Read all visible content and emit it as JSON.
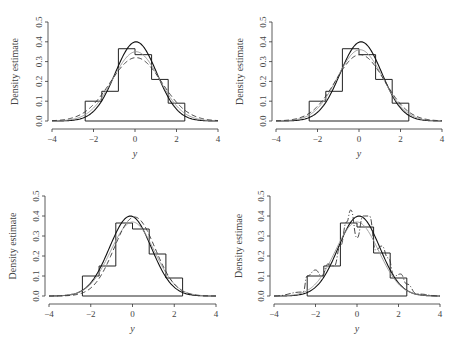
{
  "chart_data": [
    {
      "type": "line",
      "panel": "top-left",
      "xlabel": "y",
      "ylabel": "Density estimate",
      "xlim": [
        -4,
        4
      ],
      "ylim": [
        0,
        0.5
      ],
      "xticks": [
        "-4",
        "-2",
        "0",
        "2",
        "4"
      ],
      "yticks": [
        "0.0",
        "0.1",
        "0.2",
        "0.3",
        "0.4",
        "0.5"
      ],
      "histogram": {
        "bin_edges": [
          -2.4,
          -1.6,
          -0.8,
          0.0,
          0.8,
          1.6,
          2.4
        ],
        "heights": [
          0.1,
          0.15,
          0.365,
          0.335,
          0.21,
          0.09
        ]
      },
      "series": [
        {
          "name": "true density (solid)",
          "style": "solid",
          "peak": 0.4,
          "sd": 1.0,
          "mean": 0.05
        },
        {
          "name": "estimate (gray)",
          "style": "gray",
          "peak": 0.35,
          "sd": 1.12,
          "mean": 0.05
        },
        {
          "name": "estimate (dashed)",
          "style": "dashed",
          "peak": 0.32,
          "sd": 1.25,
          "mean": 0.05
        }
      ],
      "grid": false
    },
    {
      "type": "line",
      "panel": "top-right",
      "xlabel": "y",
      "ylabel": "Density estimate",
      "xlim": [
        -4,
        4
      ],
      "ylim": [
        0,
        0.5
      ],
      "xticks": [
        "-4",
        "-2",
        "0",
        "2",
        "4"
      ],
      "yticks": [
        "0.0",
        "0.1",
        "0.2",
        "0.3",
        "0.4",
        "0.5"
      ],
      "histogram": {
        "bin_edges": [
          -2.4,
          -1.6,
          -0.8,
          0.0,
          0.8,
          1.6,
          2.4
        ],
        "heights": [
          0.1,
          0.15,
          0.365,
          0.335,
          0.21,
          0.09
        ]
      },
      "series": [
        {
          "name": "true density (solid)",
          "style": "solid",
          "peak": 0.4,
          "sd": 1.0,
          "mean": 0.1
        },
        {
          "name": "estimate (gray)",
          "style": "gray",
          "peak": 0.36,
          "sd": 1.1,
          "mean": 0.05
        },
        {
          "name": "estimate (dashed)",
          "style": "dashed",
          "peak": 0.335,
          "sd": 1.18,
          "mean": 0.05
        }
      ],
      "grid": false
    },
    {
      "type": "line",
      "panel": "bottom-left",
      "xlabel": "y",
      "ylabel": "Density estimate",
      "xlim": [
        -4,
        4
      ],
      "ylim": [
        0,
        0.5
      ],
      "xticks": [
        "-4",
        "-2",
        "0",
        "2",
        "4"
      ],
      "yticks": [
        "0.0",
        "0.1",
        "0.2",
        "0.3",
        "0.4",
        "0.5"
      ],
      "histogram": {
        "bin_edges": [
          -2.4,
          -1.6,
          -0.8,
          0.0,
          0.8,
          1.6,
          2.4
        ],
        "heights": [
          0.1,
          0.15,
          0.365,
          0.335,
          0.21,
          0.09
        ]
      },
      "series": [
        {
          "name": "true density (solid)",
          "style": "solid",
          "peak": 0.4,
          "sd": 1.0,
          "mean": -0.1
        },
        {
          "name": "estimate (gray)",
          "style": "gray",
          "peak": 0.37,
          "sd": 1.05,
          "mean": 0.0
        },
        {
          "name": "estimate (dashed)",
          "style": "dashed",
          "peak": 0.395,
          "sd": 0.98,
          "mean": 0.1
        }
      ],
      "grid": false
    },
    {
      "type": "line",
      "panel": "bottom-right",
      "xlabel": "y",
      "ylabel": "Density estimate",
      "xlim": [
        -4,
        4
      ],
      "ylim": [
        0,
        0.5
      ],
      "xticks": [
        "-4",
        "-2",
        "0",
        "2",
        "4"
      ],
      "yticks": [
        "0.0",
        "0.1",
        "0.2",
        "0.3",
        "0.4",
        "0.5"
      ],
      "histogram": {
        "bin_edges": [
          -2.4,
          -1.6,
          -0.8,
          0.0,
          0.8,
          1.6,
          2.4
        ],
        "heights": [
          0.1,
          0.15,
          0.365,
          0.345,
          0.215,
          0.09
        ]
      },
      "series": [
        {
          "name": "true density (solid)",
          "style": "solid",
          "peak": 0.4,
          "sd": 1.0,
          "mean": 0.1
        },
        {
          "name": "estimate (gray)",
          "style": "gray",
          "peak": 0.37,
          "sd": 1.05,
          "mean": 0.0
        },
        {
          "name": "wiggly estimate (dash-dot)",
          "style": "dashdot",
          "x": [
            -2.4,
            -2.0,
            -1.7,
            -1.4,
            -1.1,
            -0.8,
            -0.5,
            -0.3,
            0.0,
            0.3,
            0.6,
            0.9,
            1.2,
            1.5,
            1.8,
            2.1,
            2.4
          ],
          "y": [
            0.1,
            0.13,
            0.1,
            0.16,
            0.15,
            0.25,
            0.37,
            0.43,
            0.29,
            0.4,
            0.4,
            0.23,
            0.25,
            0.19,
            0.1,
            0.11,
            0.06
          ]
        }
      ],
      "grid": false
    }
  ],
  "labels": {
    "ylabel": "Density estimate",
    "ylabel_bottom_right": "Density estimae",
    "xlabel": "y"
  }
}
